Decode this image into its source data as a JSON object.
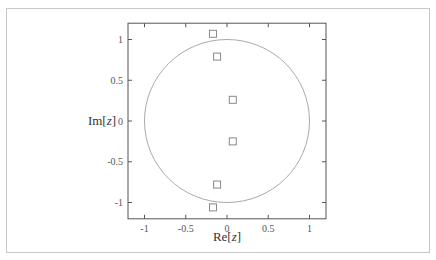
{
  "chart_data": {
    "type": "scatter",
    "title": "",
    "xlabel": "Re[z]",
    "ylabel": "Im[z]",
    "xlabel_parts": {
      "pre": "Re[",
      "var": "z",
      "post": "]"
    },
    "ylabel_parts": {
      "pre": "Im[",
      "var": "z",
      "post": "]"
    },
    "xlim": [
      -1.2,
      1.2
    ],
    "ylim": [
      -1.2,
      1.2
    ],
    "xticks": [
      -1,
      -0.5,
      0,
      0.5,
      1
    ],
    "yticks": [
      -1,
      -0.5,
      0,
      0.5,
      1
    ],
    "xtick_labels": [
      "-1",
      "-0.5",
      "0",
      "0.5",
      "1"
    ],
    "ytick_labels": [
      "-1",
      "-0.5",
      "0",
      "0.5",
      "1"
    ],
    "grid": false,
    "legend": null,
    "series": [
      {
        "name": "points",
        "marker": "open-square",
        "points": [
          {
            "x": -0.17,
            "y": 1.07
          },
          {
            "x": -0.12,
            "y": 0.79
          },
          {
            "x": 0.07,
            "y": 0.26
          },
          {
            "x": 0.07,
            "y": -0.25
          },
          {
            "x": -0.12,
            "y": -0.78
          },
          {
            "x": -0.17,
            "y": -1.06
          }
        ]
      },
      {
        "name": "unit circle",
        "type": "circle",
        "center": {
          "x": 0,
          "y": 0
        },
        "radius": 1
      }
    ]
  },
  "colors": {
    "frame": "#555555",
    "circle": "#aaaaaa",
    "marker": "#888888",
    "outer_border": "#c8c8c8"
  }
}
